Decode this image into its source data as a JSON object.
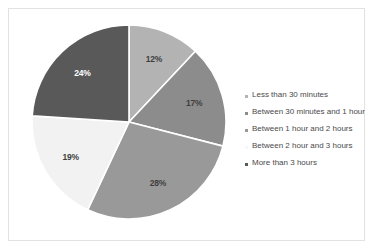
{
  "chart_data": {
    "type": "pie",
    "title": "",
    "categories": [
      "Less than 30 minutes",
      "Between 30 minutes and 1 hour",
      "Between 1 hour and 2 hours",
      "Between 2 hour and 3 hours",
      "More than 3 hours"
    ],
    "values": [
      12,
      17,
      28,
      19,
      24
    ],
    "data_labels": [
      "12%",
      "17%",
      "28%",
      "19%",
      "24%"
    ],
    "colors": [
      "#b3b3b3",
      "#8c8c8c",
      "#999999",
      "#f2f2f2",
      "#595959"
    ],
    "label_colors": [
      "#3f3f3f",
      "#3f3f3f",
      "#3f3f3f",
      "#3f3f3f",
      "#ffffff"
    ],
    "legend_position": "right",
    "start_angle": 0,
    "direction": "clockwise",
    "grid": false,
    "slice_border_color": "#ffffff"
  },
  "legend": {
    "items": [
      {
        "label": "Less than 30 minutes",
        "marker_color": "#b3b3b3",
        "value": "12%"
      },
      {
        "label": "Between 30 minutes and 1 hour",
        "marker_color": "#8c8c8c",
        "value": "17%"
      },
      {
        "label": "Between 1 hour and 2 hours",
        "marker_color": "#999999",
        "value": "28%"
      },
      {
        "label": "Between 2 hour and 3 hours",
        "marker_color": "#f7f7f7",
        "value": "19%"
      },
      {
        "label": "More than 3 hours",
        "marker_color": "#595959",
        "value": "24%"
      }
    ]
  },
  "card": {
    "border_color": "#e2e2e2",
    "background": "#ffffff"
  }
}
